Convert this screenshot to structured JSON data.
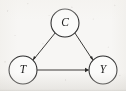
{
  "figure": {
    "kind": "causal-dag",
    "caption": "",
    "background_color": "#f7f6f4",
    "stroke_color": "#2c2c2c",
    "node_fill_color": "#fbfbfa",
    "label_color": "#1c1c1c",
    "width": 126,
    "height": 91
  },
  "nodes": [
    {
      "id": "C",
      "label": "C",
      "cx": 65,
      "cy": 23,
      "r": 14
    },
    {
      "id": "T",
      "label": "T",
      "cx": 23,
      "cy": 70,
      "r": 14
    },
    {
      "id": "Y",
      "label": "Y",
      "cx": 103,
      "cy": 70,
      "r": 14
    }
  ],
  "edges": [
    {
      "id": "C-T",
      "from": "C",
      "to": "T",
      "arrow": "to",
      "label": ""
    },
    {
      "id": "C-Y",
      "from": "C",
      "to": "Y",
      "arrow": "to",
      "label": ""
    },
    {
      "id": "T-Y",
      "from": "T",
      "to": "Y",
      "arrow": "to",
      "label": ""
    }
  ]
}
